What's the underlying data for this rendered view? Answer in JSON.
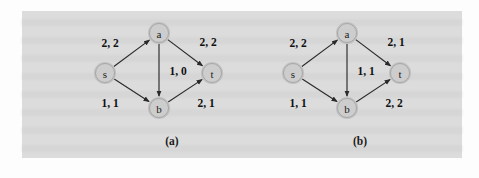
{
  "figure": {
    "page_background": "#fdfdfd",
    "panel_background": "#dcdcdc",
    "node_fill": "#cdcdcd",
    "node_stroke": "#a8a8a8",
    "edge_color": "#2a2a2a",
    "label_color": "#111111"
  },
  "chart_data": {
    "type": "diagram",
    "title": "",
    "subtitle": "",
    "diagram_kind": "flow-network",
    "edge_label_format": "capacity, flow",
    "panels": [
      {
        "caption": "(a)",
        "nodes": [
          {
            "id": "s",
            "label": "s",
            "x": 43,
            "y": 62
          },
          {
            "id": "a",
            "label": "a",
            "x": 97,
            "y": 22
          },
          {
            "id": "b",
            "label": "b",
            "x": 97,
            "y": 97
          },
          {
            "id": "t",
            "label": "t",
            "x": 150,
            "y": 62
          }
        ],
        "edges": [
          {
            "from": "s",
            "to": "a",
            "capacity": 2,
            "flow": 2,
            "label": "2, 2",
            "label_x": 48,
            "label_y": 32
          },
          {
            "from": "s",
            "to": "b",
            "capacity": 1,
            "flow": 1,
            "label": "1, 1",
            "label_x": 48,
            "label_y": 92
          },
          {
            "from": "a",
            "to": "b",
            "capacity": 1,
            "flow": 0,
            "label": "1, 0",
            "label_x": 116,
            "label_y": 60
          },
          {
            "from": "a",
            "to": "t",
            "capacity": 2,
            "flow": 2,
            "label": "2, 2",
            "label_x": 146,
            "label_y": 31
          },
          {
            "from": "b",
            "to": "t",
            "capacity": 2,
            "flow": 1,
            "label": "2, 1",
            "label_x": 144,
            "label_y": 92
          }
        ]
      },
      {
        "caption": "(b)",
        "nodes": [
          {
            "id": "s",
            "label": "s",
            "x": 43,
            "y": 62
          },
          {
            "id": "a",
            "label": "a",
            "x": 97,
            "y": 22
          },
          {
            "id": "b",
            "label": "b",
            "x": 97,
            "y": 97
          },
          {
            "id": "t",
            "label": "t",
            "x": 150,
            "y": 62
          }
        ],
        "edges": [
          {
            "from": "s",
            "to": "a",
            "capacity": 2,
            "flow": 2,
            "label": "2, 2",
            "label_x": 48,
            "label_y": 32
          },
          {
            "from": "s",
            "to": "b",
            "capacity": 1,
            "flow": 1,
            "label": "1, 1",
            "label_x": 48,
            "label_y": 92
          },
          {
            "from": "a",
            "to": "b",
            "capacity": 1,
            "flow": 1,
            "label": "1, 1",
            "label_x": 116,
            "label_y": 60
          },
          {
            "from": "a",
            "to": "t",
            "capacity": 2,
            "flow": 1,
            "label": "2, 1",
            "label_x": 146,
            "label_y": 31
          },
          {
            "from": "b",
            "to": "t",
            "capacity": 2,
            "flow": 2,
            "label": "2, 2",
            "label_x": 144,
            "label_y": 92
          }
        ]
      }
    ]
  }
}
